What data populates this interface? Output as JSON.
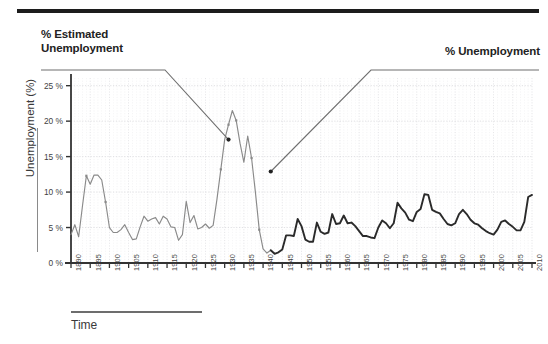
{
  "figure": {
    "top_rule": "divider",
    "ylabel": "Unemployment (%)",
    "xlabel": "Time",
    "callout_left": "% Estimated\nUnemployment",
    "callout_left_line1": "% Estimated",
    "callout_left_line2": "Unemployment",
    "callout_right": "% Unemployment"
  },
  "colors": {
    "estimated_series": "#8a8a8a",
    "official_series": "#2a2a2a",
    "gridline": "#d8d8dc",
    "axis": "#333333",
    "rule": "#1c1c1c",
    "text": "#2b2b2b"
  },
  "chart_data": {
    "type": "line",
    "title": "",
    "subtitle": "",
    "xlabel": "Time",
    "ylabel": "Unemployment (%)",
    "xlim": [
      1890,
      2010
    ],
    "ylim": [
      0,
      25.8
    ],
    "grid": true,
    "legend_position": "callouts",
    "ytick_labels": [
      "0 %",
      "5 %",
      "10 %",
      "15 %",
      "20 %",
      "25 %"
    ],
    "yticks": [
      0,
      5,
      10,
      15,
      20,
      25
    ],
    "xticks": [
      1890,
      1895,
      1900,
      1905,
      1910,
      1915,
      1920,
      1925,
      1930,
      1935,
      1940,
      1945,
      1950,
      1955,
      1960,
      1965,
      1970,
      1975,
      1980,
      1985,
      1990,
      1995,
      2000,
      2005,
      2010
    ],
    "xtick_labels": [
      "1890",
      "1895",
      "1900",
      "1905",
      "1910",
      "1915",
      "1920",
      "1925",
      "1930",
      "1935",
      "1940",
      "1945",
      "1950",
      "1955",
      "1960",
      "1965",
      "1970",
      "1975",
      "1980",
      "1985",
      "1990",
      "1995",
      "2000",
      "2005",
      "2010"
    ],
    "annotations": [
      {
        "text": "% Estimated Unemployment",
        "points_to_year": 1931,
        "points_to_value": 17.4
      },
      {
        "text": "% Unemployment",
        "points_to_year": 1942,
        "points_to_value": 12.9
      }
    ],
    "series": [
      {
        "name": "% Estimated Unemployment",
        "color": "#8a8a8a",
        "x": [
          1890,
          1891,
          1892,
          1893,
          1894,
          1895,
          1896,
          1897,
          1898,
          1899,
          1900,
          1901,
          1902,
          1903,
          1904,
          1905,
          1906,
          1907,
          1908,
          1909,
          1910,
          1911,
          1912,
          1913,
          1914,
          1915,
          1916,
          1917,
          1918,
          1919,
          1920,
          1921,
          1922,
          1923,
          1924,
          1925,
          1926,
          1927,
          1928,
          1929,
          1930,
          1931,
          1932,
          1933,
          1934,
          1935,
          1936,
          1937,
          1938,
          1939,
          1940,
          1941,
          1942
        ],
        "values": [
          4.0,
          5.4,
          3.7,
          8.1,
          12.3,
          11.1,
          12.4,
          12.4,
          11.7,
          8.6,
          5.0,
          4.3,
          4.3,
          4.7,
          5.4,
          4.3,
          3.3,
          3.4,
          5.1,
          6.6,
          5.9,
          6.2,
          6.4,
          5.5,
          6.6,
          6.2,
          5.1,
          5.0,
          3.2,
          4.0,
          8.7,
          5.7,
          6.7,
          4.8,
          5.0,
          5.5,
          4.9,
          5.3,
          9.0,
          13.2,
          17.4,
          19.5,
          21.5,
          20.1,
          16.9,
          14.2,
          17.9,
          14.8,
          10.0,
          4.7,
          2.0,
          1.4,
          1.8
        ]
      },
      {
        "name": "% Unemployment",
        "color": "#2a2a2a",
        "x": [
          1942,
          1943,
          1944,
          1945,
          1946,
          1947,
          1948,
          1949,
          1950,
          1951,
          1952,
          1953,
          1954,
          1955,
          1956,
          1957,
          1958,
          1959,
          1960,
          1961,
          1962,
          1963,
          1964,
          1965,
          1966,
          1967,
          1968,
          1969,
          1970,
          1971,
          1972,
          1973,
          1974,
          1975,
          1976,
          1977,
          1978,
          1979,
          1980,
          1981,
          1982,
          1983,
          1984,
          1985,
          1986,
          1987,
          1988,
          1989,
          1990,
          1991,
          1992,
          1993,
          1994,
          1995,
          1996,
          1997,
          1998,
          1999,
          2000,
          2001,
          2002,
          2003,
          2004,
          2005,
          2006,
          2007,
          2008,
          2009,
          2010
        ],
        "values": [
          1.8,
          1.3,
          1.5,
          1.9,
          3.9,
          3.9,
          3.8,
          6.2,
          5.2,
          3.3,
          3.0,
          3.0,
          5.7,
          4.4,
          4.1,
          4.3,
          6.9,
          5.5,
          5.6,
          6.7,
          5.6,
          5.7,
          5.2,
          4.5,
          3.8,
          3.8,
          3.6,
          3.5,
          5.0,
          6.0,
          5.6,
          4.9,
          5.6,
          8.5,
          7.7,
          7.1,
          6.1,
          5.9,
          7.2,
          7.6,
          9.7,
          9.6,
          7.5,
          7.2,
          7.0,
          6.2,
          5.5,
          5.3,
          5.6,
          6.9,
          7.5,
          6.9,
          6.1,
          5.6,
          5.4,
          4.9,
          4.5,
          4.2,
          4.0,
          4.7,
          5.8,
          6.0,
          5.5,
          5.1,
          4.6,
          4.6,
          5.8,
          9.3,
          9.6
        ]
      }
    ],
    "marker_points_estimated": [
      {
        "year": 1894,
        "value": 12.3
      },
      {
        "year": 1899,
        "value": 8.6
      },
      {
        "year": 1929,
        "value": 13.2
      },
      {
        "year": 1931,
        "value": 19.5
      },
      {
        "year": 1933,
        "value": 20.1
      },
      {
        "year": 1937,
        "value": 14.8
      },
      {
        "year": 1939,
        "value": 4.7
      }
    ]
  }
}
